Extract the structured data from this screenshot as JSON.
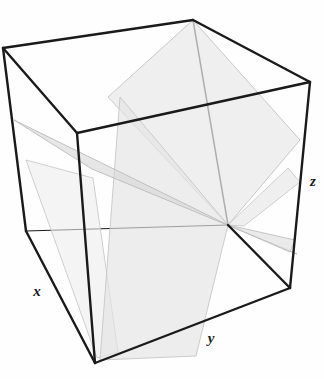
{
  "figure": {
    "kind": "3d-geometry-illustration",
    "background_color": "#fefefe",
    "edge_color": "#1a1a1a",
    "axis_labels": [
      {
        "name": "x",
        "text": "x",
        "x": 37,
        "y": 296
      },
      {
        "name": "y",
        "text": "y",
        "x": 211,
        "y": 343
      },
      {
        "name": "z",
        "text": "z",
        "x": 313,
        "y": 186
      }
    ],
    "cube": {
      "label": "wireframe-cube",
      "stroke": "#1a1a1a",
      "stroke_width": 2.4,
      "vertices": {
        "back_top": [
          193,
          20
        ],
        "left_top": [
          3,
          48
        ],
        "right_top": [
          310,
          82
        ],
        "front_top": [
          77,
          133
        ],
        "left_bottom": [
          26,
          231
        ],
        "right_bottom": [
          290,
          288
        ],
        "front_bottom": [
          95,
          363
        ],
        "back_bottom": [
          228,
          225
        ]
      },
      "visible_edges": [
        [
          "back_top",
          "left_top"
        ],
        [
          "back_top",
          "right_top"
        ],
        [
          "left_top",
          "front_top"
        ],
        [
          "right_top",
          "front_top"
        ],
        [
          "left_top",
          "left_bottom"
        ],
        [
          "right_top",
          "right_bottom"
        ],
        [
          "front_top",
          "front_bottom"
        ],
        [
          "left_bottom",
          "front_bottom"
        ],
        [
          "right_bottom",
          "front_bottom"
        ],
        [
          "back_bottom",
          "right_bottom"
        ]
      ],
      "hidden_edges": [
        [
          "back_top",
          "back_bottom"
        ],
        [
          "left_bottom",
          "back_bottom"
        ]
      ]
    },
    "planes": [
      {
        "name": "plane-upper-diagonal",
        "description": "Large quadrilateral slicing from back-top corner down to the right",
        "fill": "#e9e9e9",
        "fill_opacity": 0.72,
        "stroke": "#c2c2c2",
        "stroke_width": 0.9,
        "points": "193,20 300,140 228,225 108,97"
      },
      {
        "name": "plane-lower-left-diagonal",
        "description": "Plane sloping from upper-left edge down through centre to the right border",
        "fill": "#d6d6d6",
        "fill_opacity": 0.62,
        "stroke": "#bbbbbb",
        "stroke_width": 0.9,
        "points": "14,120 228,225 297,254 92,169"
      },
      {
        "name": "plane-front-vertical",
        "description": "Near-vertical plane running from upper area down to the bottom front",
        "fill": "#e4e4e4",
        "fill_opacity": 0.66,
        "stroke": "#c6c6c6",
        "stroke_width": 0.9,
        "points": "228,225 120,97 100,360 196,356"
      },
      {
        "name": "plane-left-flap",
        "description": "Thin sliver plane on the left side of the cube",
        "fill": "#ececec",
        "fill_opacity": 0.6,
        "stroke": "#c9c9c9",
        "stroke_width": 0.9,
        "points": "26,160 93,178 118,352 97,358"
      },
      {
        "name": "plane-right-spike",
        "description": "Narrow wedge protruding past the right edge of the cube",
        "fill": "#dcdcdc",
        "fill_opacity": 0.6,
        "stroke": "#c0c0c0",
        "stroke_width": 0.9,
        "points": "228,225 295,240 290,252"
      }
    ]
  }
}
